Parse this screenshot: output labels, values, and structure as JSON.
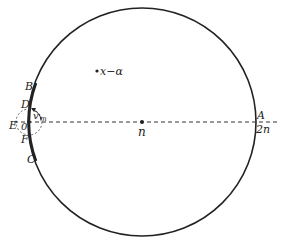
{
  "diagram": {
    "points": {
      "A": "A",
      "B": "B",
      "C": "C",
      "D": "D",
      "E": "E",
      "F": "F",
      "O": "0",
      "center": "n",
      "right_value": "2n",
      "interior_point": "x−α",
      "angle_label": "v",
      "angle_subscript": "m"
    },
    "colors": {
      "stroke": "#222222",
      "background": "#ffffff"
    }
  }
}
